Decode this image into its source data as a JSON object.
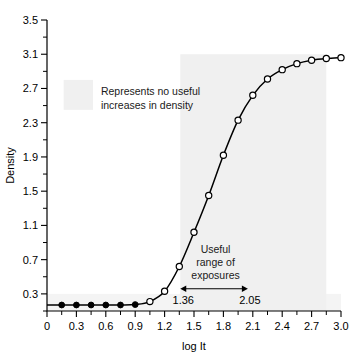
{
  "chart_data": {
    "type": "line",
    "title": "",
    "xlabel": "log It",
    "ylabel": "Density",
    "xlim": [
      0,
      3.0
    ],
    "ylim": [
      0.1,
      3.5
    ],
    "grid": false,
    "legend": null,
    "x_ticks": [
      "0",
      "0.3",
      "0.6",
      "0.9",
      "1.2",
      "1.5",
      "1.8",
      "2.1",
      "2.4",
      "2.7",
      "3.0"
    ],
    "x_tick_values": [
      0,
      0.3,
      0.6,
      0.9,
      1.2,
      1.5,
      1.8,
      2.1,
      2.4,
      2.7,
      3.0
    ],
    "y_ticks": [
      "0.3",
      "0.7",
      "1.1",
      "1.5",
      "1.9",
      "2.3",
      "2.7",
      "3.1",
      "3.5"
    ],
    "y_tick_values": [
      0.3,
      0.7,
      1.1,
      1.5,
      1.9,
      2.3,
      2.7,
      3.1,
      3.5
    ],
    "x_minor_step": 0.15,
    "y_minor_step": 0.2,
    "series": [
      {
        "name": "characteristic-curve",
        "marker_filled_x": [
          0.15,
          0.3,
          0.45,
          0.6,
          0.75,
          0.9
        ],
        "marker_filled_y": [
          0.17,
          0.17,
          0.17,
          0.17,
          0.17,
          0.175
        ],
        "marker_open_x": [
          1.05,
          1.2,
          1.35,
          1.5,
          1.65,
          1.8,
          1.95,
          2.1,
          2.25,
          2.4,
          2.55,
          2.7,
          2.85,
          3.0
        ],
        "marker_open_y": [
          0.21,
          0.33,
          0.62,
          1.02,
          1.45,
          1.92,
          2.33,
          2.62,
          2.81,
          2.92,
          2.99,
          3.03,
          3.05,
          3.06
        ],
        "x": [
          0.0,
          0.15,
          0.3,
          0.45,
          0.6,
          0.75,
          0.9,
          1.05,
          1.2,
          1.35,
          1.5,
          1.65,
          1.8,
          1.95,
          2.1,
          2.25,
          2.4,
          2.55,
          2.7,
          2.85,
          3.0
        ],
        "y": [
          0.17,
          0.17,
          0.17,
          0.17,
          0.17,
          0.17,
          0.175,
          0.21,
          0.33,
          0.62,
          1.02,
          1.45,
          1.92,
          2.33,
          2.62,
          2.81,
          2.92,
          2.99,
          3.03,
          3.05,
          3.06
        ]
      }
    ],
    "annotations": [
      {
        "id": "no-useful-increases",
        "lines": [
          "Represents no useful",
          "increases in density"
        ],
        "x": 0.55,
        "y": 2.62
      },
      {
        "id": "useful-range",
        "lines": [
          "Useful",
          "range of",
          "exposures"
        ],
        "x": 1.72,
        "y": 0.78
      }
    ],
    "range_marker": {
      "start_value": 1.36,
      "end_value": 2.05,
      "start_label": "1.36",
      "end_label": "2.05",
      "caption": "Useful range of exposures"
    },
    "shaded_regions": [
      {
        "id": "toe-shoulder-band",
        "x0": 0.0,
        "x1": 3.0,
        "y0": 0.1,
        "y1": 0.3
      },
      {
        "id": "useful-exposure-shade",
        "x0": 1.36,
        "x1": 2.85,
        "y0": 0.1,
        "y1": 3.1
      },
      {
        "id": "legend-swatch",
        "x0": 0.17,
        "x1": 0.47,
        "y0": 2.45,
        "y1": 2.8
      }
    ]
  },
  "colors": {
    "background": "#ffffff",
    "axis": "#000000",
    "curve": "#000000",
    "marker_open_fill": "#ffffff",
    "marker_filled_fill": "#000000",
    "shade": "#f0f0f0",
    "shade_light": "#f4f4f4",
    "text": "#000000"
  }
}
